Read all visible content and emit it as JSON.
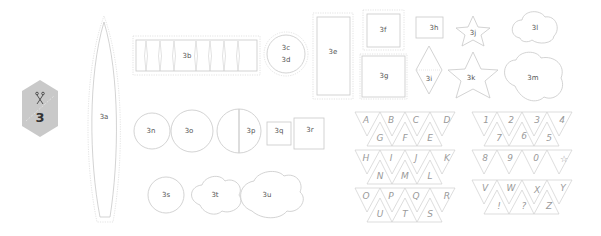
{
  "badge": {
    "number": "3",
    "icon": "scissors-icon",
    "color": "#c9c9c9"
  },
  "pieces": {
    "a": "3a",
    "b": "3b",
    "c": "3c",
    "d": "3d",
    "e": "3e",
    "f": "3f",
    "g": "3g",
    "h": "3h",
    "i": "3i",
    "j": "3j",
    "k": "3k",
    "l": "3l",
    "m": "3m",
    "n": "3n",
    "o": "3o",
    "p": "3p",
    "q": "3q",
    "r": "3r",
    "s": "3s",
    "t": "3t",
    "u": "3u"
  },
  "bunting_left": {
    "row1_top": [
      "A",
      "B",
      "C",
      "D"
    ],
    "row1_bottom": [
      "G",
      "F",
      "E"
    ],
    "row2_top": [
      "H",
      "I",
      "J",
      "K"
    ],
    "row2_bottom": [
      "N",
      "M",
      "L"
    ],
    "row3_top": [
      "O",
      "P",
      "Q",
      "R"
    ],
    "row3_bottom": [
      "U",
      "T",
      "S"
    ]
  },
  "bunting_right": {
    "row1_top": [
      "1",
      "2",
      "3",
      "4"
    ],
    "row1_bottom": [
      "7",
      "6",
      "5"
    ],
    "row2_top": [
      "8",
      "9",
      "0",
      "☆"
    ],
    "row3_top": [
      "V",
      "W",
      "X",
      "Y"
    ],
    "row3_bottom": [
      "!",
      "?",
      "Z"
    ]
  }
}
